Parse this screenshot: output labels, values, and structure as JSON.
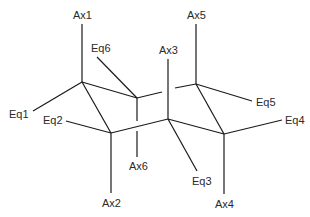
{
  "diagram": {
    "labels": {
      "ax1": "Ax1",
      "ax2": "Ax2",
      "ax3": "Ax3",
      "ax4": "Ax4",
      "ax5": "Ax5",
      "ax6": "Ax6",
      "eq1": "Eq1",
      "eq2": "Eq2",
      "eq3": "Eq3",
      "eq4": "Eq4",
      "eq5": "Eq5",
      "eq6": "Eq6"
    },
    "line_color": "#1a1a1a",
    "text_color": "#2a2a2a"
  }
}
